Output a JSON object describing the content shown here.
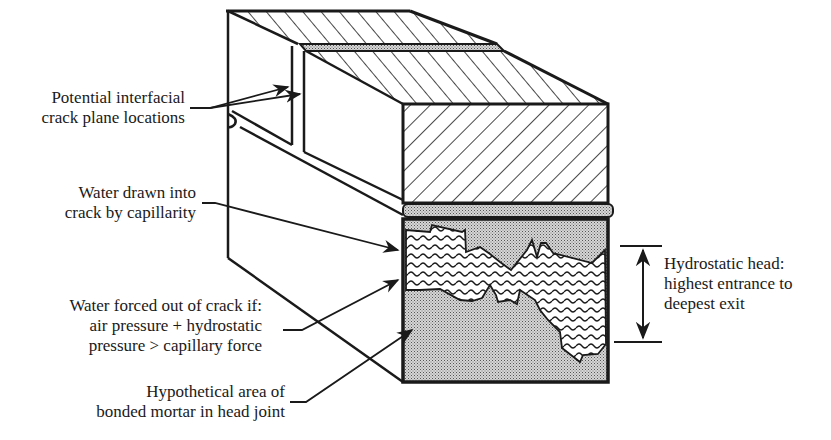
{
  "diagram": {
    "type": "technical-cross-section",
    "colors": {
      "ink": "#1a1a1a",
      "background": "#ffffff",
      "mortar_fill": "#bdbdbd"
    },
    "labels": {
      "crack_planes": {
        "line1": "Potential interfacial",
        "line2": "crack plane locations"
      },
      "capillarity": {
        "line1": "Water drawn into",
        "line2": "crack by capillarity"
      },
      "forced_out": {
        "line1": "Water forced out of crack if:",
        "line2": "air pressure + hydrostatic",
        "line3": "pressure > capillary force"
      },
      "bonded_mortar": {
        "line1": "Hypothetical area of",
        "line2": "bonded mortar in head joint"
      },
      "hydrostatic_head": {
        "line1": "Hydrostatic head:",
        "line2": "highest entrance to",
        "line3": "deepest exit"
      }
    },
    "components": [
      {
        "name": "upper brick (hatched)",
        "pattern": "diagonal-hatch"
      },
      {
        "name": "bed joint mortar",
        "pattern": "dot-stipple"
      },
      {
        "name": "head joint bonded mortar",
        "pattern": "dot-stipple"
      },
      {
        "name": "water in crack",
        "pattern": "wavy-lines"
      },
      {
        "name": "hydrostatic head dimension",
        "pattern": "double-arrow"
      }
    ]
  }
}
